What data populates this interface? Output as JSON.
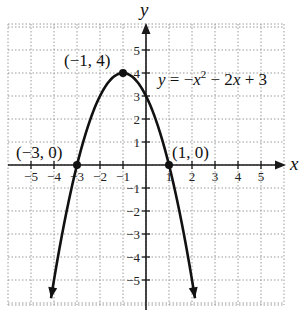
{
  "chart_data": {
    "type": "line",
    "title": "",
    "function": "y = -x^2 - 2x + 3",
    "coefficients": {
      "a": -1,
      "b": -2,
      "c": 3
    },
    "xlabel": "x",
    "ylabel": "y",
    "xlim": [
      -6,
      6
    ],
    "ylim": [
      -6,
      6
    ],
    "grid": true,
    "x_ticks": [
      -5,
      -4,
      -3,
      -2,
      -1,
      1,
      2,
      3,
      4,
      5
    ],
    "y_ticks": [
      -5,
      -4,
      -3,
      -2,
      -1,
      1,
      2,
      3,
      4,
      5
    ],
    "x_tick_labels": [
      "−5",
      "−4",
      "−3",
      "−2",
      "−1",
      "1",
      "2",
      "3",
      "4",
      "5"
    ],
    "y_tick_labels": [
      "−5",
      "−4",
      "−3",
      "−2",
      "−1",
      "1",
      "2",
      "3",
      "4",
      "5"
    ],
    "curve_x_range": [
      -4.13,
      2.13
    ],
    "curve_ends_with_arrows": true,
    "points": [
      {
        "x": -1,
        "y": 4,
        "label": "(−1, 4)",
        "role": "vertex"
      },
      {
        "x": -3,
        "y": 0,
        "label": "(−3, 0)",
        "role": "x-intercept"
      },
      {
        "x": 1,
        "y": 0,
        "label": "(1, 0)",
        "role": "x-intercept"
      }
    ],
    "annotations": [
      {
        "text": "y = −x² − 2x + 3",
        "x": 0.4,
        "y": 3.6
      }
    ],
    "legend": null,
    "colors": {
      "curve": "#111111",
      "axes": "#1a1a1a",
      "grid": "#9a9a9a",
      "background": "#ffffff"
    }
  },
  "labels": {
    "x_axis": "x",
    "y_axis": "y",
    "vertex": "(−1, 4)",
    "left_intercept": "(−3, 0)",
    "right_intercept": "(1, 0)",
    "equation_y": "y",
    "equation_eq": " = −",
    "equation_x": "x",
    "equation_sup": "2",
    "equation_rest": " − 2",
    "equation_x2": "x",
    "equation_tail": " + 3"
  }
}
